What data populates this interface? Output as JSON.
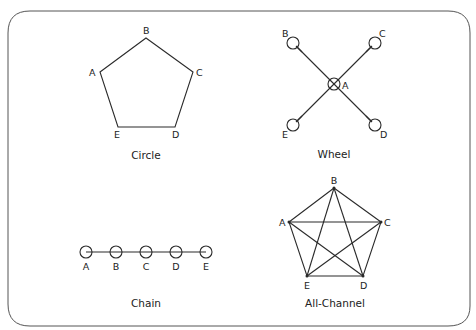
{
  "diagrams": {
    "circle": {
      "caption": "Circle",
      "nodes": {
        "A": "A",
        "B": "B",
        "C": "C",
        "D": "D",
        "E": "E"
      },
      "edges": [
        [
          "A",
          "B"
        ],
        [
          "B",
          "C"
        ],
        [
          "C",
          "D"
        ],
        [
          "D",
          "E"
        ],
        [
          "E",
          "A"
        ]
      ]
    },
    "wheel": {
      "caption": "Wheel",
      "hub": "A",
      "nodes": {
        "A": "A",
        "B": "B",
        "C": "C",
        "D": "D",
        "E": "E"
      },
      "edges": [
        [
          "A",
          "B"
        ],
        [
          "A",
          "C"
        ],
        [
          "A",
          "D"
        ],
        [
          "A",
          "E"
        ]
      ]
    },
    "chain": {
      "caption": "Chain",
      "nodes": {
        "A": "A",
        "B": "B",
        "C": "C",
        "D": "D",
        "E": "E"
      },
      "edges": [
        [
          "A",
          "B"
        ],
        [
          "B",
          "C"
        ],
        [
          "C",
          "D"
        ],
        [
          "D",
          "E"
        ]
      ]
    },
    "all_channel": {
      "caption": "All-Channel",
      "nodes": {
        "A": "A",
        "B": "B",
        "C": "C",
        "D": "D",
        "E": "E"
      },
      "edges": [
        [
          "A",
          "B"
        ],
        [
          "A",
          "C"
        ],
        [
          "A",
          "D"
        ],
        [
          "A",
          "E"
        ],
        [
          "B",
          "C"
        ],
        [
          "B",
          "D"
        ],
        [
          "B",
          "E"
        ],
        [
          "C",
          "D"
        ],
        [
          "C",
          "E"
        ],
        [
          "D",
          "E"
        ]
      ]
    }
  },
  "colors": {
    "stroke": "#2a2a2a",
    "frame": "#555555",
    "background": "#ffffff"
  }
}
